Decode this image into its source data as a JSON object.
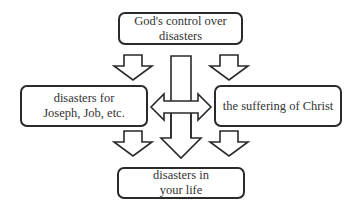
{
  "diagram": {
    "nodes": {
      "top": {
        "lines": [
          "God's control over",
          "disasters"
        ]
      },
      "left": {
        "lines": [
          "disasters for",
          "Joseph, Job, etc."
        ]
      },
      "right": {
        "lines": [
          "the suffering of Christ"
        ]
      },
      "bottom": {
        "lines": [
          "disasters in",
          "your life"
        ]
      }
    },
    "edges": [
      {
        "from": "top",
        "to": "left",
        "style": "block-arrow"
      },
      {
        "from": "top",
        "to": "right",
        "style": "block-arrow"
      },
      {
        "from": "top",
        "to": "bottom",
        "style": "block-arrow"
      },
      {
        "from": "left",
        "to": "right",
        "style": "double-block-arrow"
      },
      {
        "from": "left",
        "to": "bottom",
        "style": "block-arrow"
      },
      {
        "from": "right",
        "to": "bottom",
        "style": "block-arrow"
      }
    ],
    "colors": {
      "stroke": "#2a2a2a",
      "fill": "#ffffff",
      "text": "#333333"
    }
  }
}
